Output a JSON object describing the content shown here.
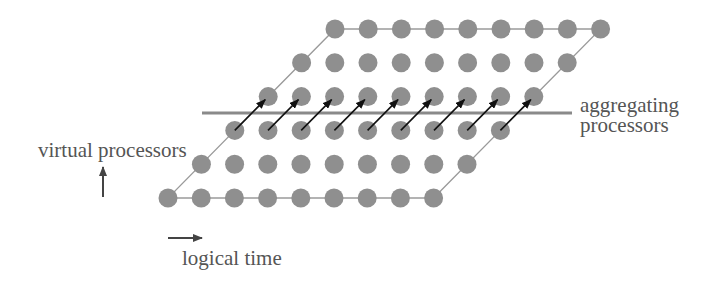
{
  "diagram": {
    "grid": {
      "rows": 6,
      "cols": 9,
      "origin": {
        "x": 168,
        "y": 198
      },
      "dx": 33.2,
      "dy": 33.8,
      "row_shift": 33.4,
      "dot_radius": 9.5,
      "dot_color": "#8f8f8f",
      "outline_color": "#9a9a9a"
    },
    "arrows": {
      "from_row": 2,
      "to_row": 3,
      "count": 9,
      "color": "#111111"
    },
    "aggregation_line": {
      "x1": 202,
      "x2": 572,
      "y": 113,
      "color": "#8a8a8a"
    },
    "labels": {
      "virtual_processors": "virtual processors",
      "aggregating": "aggregating",
      "processors": "processors",
      "logical_time": "logical time"
    },
    "axis_arrows": {
      "up": {
        "x": 103,
        "y1": 197,
        "y2": 167
      },
      "right": {
        "x1": 168,
        "x2": 202,
        "y": 238
      }
    }
  }
}
